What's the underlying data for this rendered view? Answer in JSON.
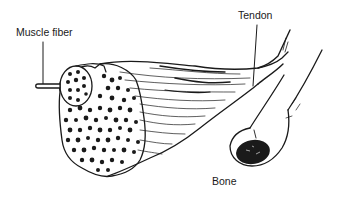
{
  "diagram": {
    "title": "",
    "labels": {
      "muscle_fiber": "Muscle fiber",
      "tendon": "Tendon",
      "bone": "Bone"
    },
    "colors": {
      "ink": "#1a1a1a",
      "background": "#ffffff"
    }
  }
}
